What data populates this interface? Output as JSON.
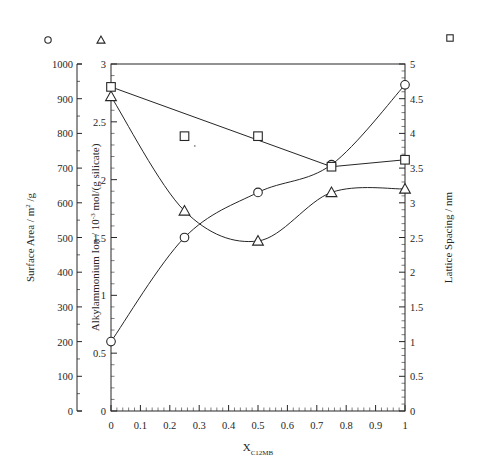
{
  "chart_data": {
    "type": "line",
    "title": "",
    "xlabel": "X_C12MB",
    "xlabel_base": "X",
    "xlabel_sub": "C12MB",
    "x": [
      0,
      0.25,
      0.5,
      0.75,
      1
    ],
    "xlim": [
      0,
      1
    ],
    "xticks": [
      "0",
      "0.1",
      "0.2",
      "0.3",
      "0.4",
      "0.5",
      "0.6",
      "0.7",
      "0.8",
      "0.9",
      "1"
    ],
    "grid": false,
    "legend_position": "top",
    "axes": [
      {
        "id": "surface-area",
        "side": "left",
        "order": 1,
        "label": "Surface Area  /  m² /g",
        "label_base": "Surface Area  /  m",
        "label_sup": "2",
        "label_tail": " /g",
        "lim": [
          0,
          1000
        ],
        "ticks": [
          "0",
          "100",
          "200",
          "300",
          "400",
          "500",
          "600",
          "700",
          "800",
          "900",
          "1000"
        ],
        "tick_values": [
          0,
          100,
          200,
          300,
          400,
          500,
          600,
          700,
          800,
          900,
          1000
        ]
      },
      {
        "id": "alkylammonium-ion",
        "side": "left",
        "order": 2,
        "label": "Alkylammonium Ion / 10⁻³ mol/(g silicate)",
        "label_base": "Alkylammonium Ion  /  10",
        "label_sup": "-3",
        "label_tail": " mol/(g silicate)",
        "lim": [
          0,
          3
        ],
        "ticks": [
          "0",
          "0.5",
          "1",
          "1.5",
          "2",
          "2.5",
          "3"
        ],
        "tick_values": [
          0,
          0.5,
          1,
          1.5,
          2,
          2.5,
          3
        ]
      },
      {
        "id": "lattice-spacing",
        "side": "right",
        "order": 1,
        "label": "Lattice Spacing  /  nm",
        "lim": [
          0,
          5
        ],
        "ticks": [
          "0",
          "0.5",
          "1",
          "1.5",
          "2",
          "2.5",
          "3",
          "3.5",
          "4",
          "4.5",
          "5"
        ],
        "tick_values": [
          0,
          0.5,
          1,
          1.5,
          2,
          2.5,
          3,
          3.5,
          4,
          4.5,
          5
        ]
      }
    ],
    "series": [
      {
        "name": "Surface Area",
        "marker": "circle",
        "axis": "surface-area",
        "units": "m2/g",
        "values": [
          200,
          500,
          630,
          710,
          940
        ],
        "connected": true
      },
      {
        "name": "Alkylammonium Ion",
        "marker": "triangle",
        "axis": "alkylammonium-ion",
        "units": "10-3 mol/(g silicate)",
        "values": [
          2.72,
          1.73,
          1.47,
          1.89,
          1.92
        ],
        "connected": true
      },
      {
        "name": "Lattice Spacing",
        "marker": "square",
        "axis": "lattice-spacing",
        "units": "nm",
        "values": [
          4.67,
          3.96,
          3.96,
          3.52,
          3.62
        ],
        "connected_indices": [
          0,
          3,
          4
        ],
        "connected": true
      }
    ],
    "legend": [
      {
        "marker": "circle",
        "axis": "surface-area",
        "label": ""
      },
      {
        "marker": "triangle",
        "axis": "alkylammonium-ion",
        "label": ""
      },
      {
        "marker": "square",
        "axis": "lattice-spacing",
        "label": ""
      }
    ]
  },
  "style": {
    "ink": "#262626",
    "background": "#ffffff",
    "line_width": "1"
  }
}
